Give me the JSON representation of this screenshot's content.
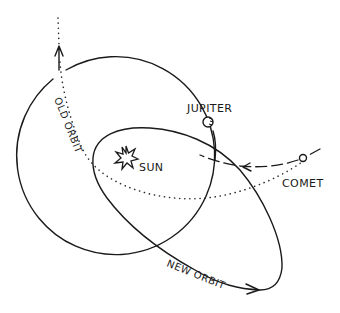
{
  "diagram": {
    "labels": {
      "jupiter": "JUPITER",
      "sun": "SUN",
      "comet": "COMET",
      "old_orbit": "OLD ORBIT",
      "new_orbit": "NEW ORBIT"
    },
    "elements": [
      {
        "id": "jupiter-orbit",
        "type": "circle",
        "style": "solid"
      },
      {
        "id": "new-orbit",
        "type": "ellipse",
        "style": "solid",
        "direction": "arrow-right"
      },
      {
        "id": "old-orbit",
        "type": "path",
        "style": "dotted",
        "direction": "arrow-up"
      },
      {
        "id": "comet-approach",
        "type": "path",
        "style": "dashed",
        "direction": "arrow-left"
      },
      {
        "id": "sun",
        "type": "star-icon"
      },
      {
        "id": "jupiter",
        "type": "planet-icon"
      },
      {
        "id": "comet",
        "type": "small-circle-icon"
      }
    ],
    "colors": {
      "ink": "#1a1a1a",
      "background": "#ffffff"
    }
  }
}
